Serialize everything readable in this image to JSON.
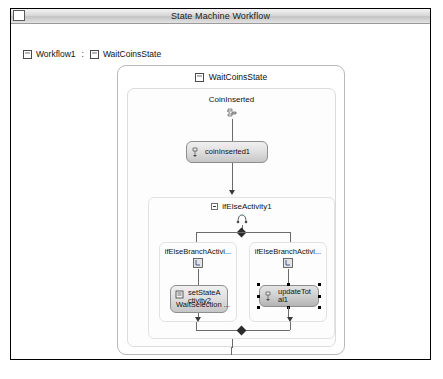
{
  "window": {
    "title": "State Machine Workflow",
    "sysmenu_icon": "system-menu-icon"
  },
  "breadcrumb": {
    "root": "Workflow1",
    "separator": ":",
    "current": "WaitCoinsState"
  },
  "canvas": {
    "state": {
      "name": "WaitCoinsState",
      "icon": "state-icon",
      "event_driven": {
        "label": "CoinInserted",
        "icon": "event-driven-icon",
        "handler": {
          "name": "coinInserted1",
          "icon": "handle-external-event-icon"
        },
        "ifelse": {
          "name": "ifElseActivity1",
          "collapse_icon": "collapse-minus-icon",
          "icon": "ifelse-icon",
          "branches": [
            {
              "label": "ifElseBranchActivi...",
              "icon": "ifelse-branch-icon",
              "activity": {
                "name": "setStateActivity2",
                "subtitle": "WaitSelection ...",
                "icon": "set-state-icon",
                "selected": false
              }
            },
            {
              "label": "ifElseBranchActivi...",
              "icon": "ifelse-branch-icon",
              "activity": {
                "name": "updateTotal1",
                "subtitle": "",
                "icon": "handle-external-event-icon",
                "selected": true
              }
            }
          ]
        }
      }
    }
  },
  "colors": {
    "window_border": "#000000",
    "activity_fill": "#dedede",
    "activity_border": "#8e8e8e",
    "connector": "#6b6b6b",
    "selection_handle": "#000000",
    "container_border": "#e2e2e2"
  }
}
